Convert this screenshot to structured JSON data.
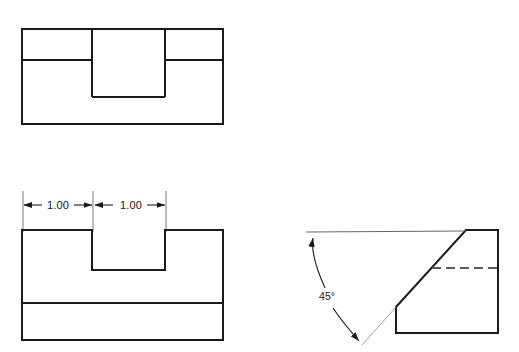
{
  "sheet": {
    "title": "Three-view orthographic drawing of a notched block with 45 degree chamfer",
    "background_color": "#ffffff",
    "line_color": "#1a1a1a",
    "thin_line_color": "#555555",
    "object_line_width": 2.0,
    "thin_line_width": 0.8,
    "width": 519,
    "height": 352
  },
  "views": {
    "top_view": {
      "name": "top-view",
      "label": "Top View",
      "outline": {
        "left": 22,
        "top": 29,
        "right": 223,
        "bottom": 124
      },
      "horizontal_edge_y": 60,
      "notch": {
        "left": 92,
        "right": 165,
        "top": 29,
        "bottom": 97
      },
      "description": "Outer rectangle with an inner rectangle projecting down from the top edge and a horizontal edge line crossing the left and right bands"
    },
    "front_view": {
      "name": "front-view",
      "label": "Front View",
      "outline": {
        "left": 22,
        "top": 230,
        "right": 223,
        "bottom": 340
      },
      "horizontal_edge_y": 303,
      "notch": {
        "left": 92,
        "right": 165,
        "top": 230,
        "bottom": 270
      },
      "description": "Rectangle with a rectangular notch cut from the top center and a horizontal edge line near the bottom"
    },
    "right_side_view": {
      "name": "right-side-view",
      "label": "Right Side View",
      "outline": {
        "left": 396,
        "top": 230,
        "right": 498,
        "bottom": 333
      },
      "chamfer": {
        "start_x": 396,
        "start_y": 307,
        "end_x": 466,
        "end_y": 230
      },
      "hidden_line": {
        "start_x": 432,
        "start_y": 268,
        "end_x": 498,
        "end_y": 268,
        "style": "dashed"
      },
      "description": "Rectangle with the upper-left corner removed by a 45 degree chamfer and a horizontal hidden (dashed) line"
    }
  },
  "dimensions": {
    "linear": [
      {
        "name": "dimension-1-left",
        "value": "1.00",
        "text_x": 58,
        "text_y": 209,
        "dim_line_y": 205,
        "extension_x_start": 23,
        "extension_x_end": 93,
        "extension_top": 191,
        "extension_bottom": 232
      },
      {
        "name": "dimension-2-right",
        "value": "1.00",
        "text_x": 131,
        "text_y": 209,
        "dim_line_y": 205,
        "extension_x_start": 93,
        "extension_x_end": 166,
        "extension_top": 191,
        "extension_bottom": 232
      }
    ],
    "angular": [
      {
        "name": "angle-dimension-45",
        "value": "45°",
        "text_x": 327,
        "text_y": 300,
        "reference_line": {
          "start_x": 306,
          "start_y": 233,
          "end_x": 466,
          "end_y": 231
        },
        "leader_top": {
          "start_x": 313,
          "start_y": 237,
          "end_x": 325,
          "end_y": 288
        },
        "leader_bottom": {
          "start_x": 333,
          "start_y": 308,
          "end_x": 360,
          "end_y": 343
        },
        "extended_chamfer": {
          "start_x": 396,
          "start_y": 307,
          "end_x": 362,
          "end_y": 345
        }
      }
    ]
  },
  "arrows": {
    "linear_arrow_count": 4,
    "angular_arrow_count": 2,
    "style": "solid filled triangular arrowhead"
  }
}
